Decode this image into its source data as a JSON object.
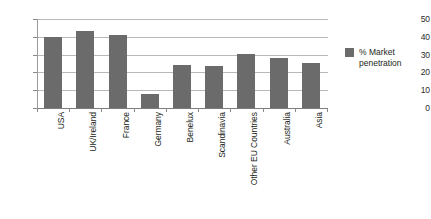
{
  "chart_data": {
    "type": "bar",
    "title": "",
    "subtitle": "",
    "xlabel": "",
    "ylabel": "",
    "ylim": [
      0,
      50
    ],
    "yticks": [
      0,
      10,
      20,
      30,
      40,
      50
    ],
    "grid": true,
    "legend_position": "right",
    "categories": [
      "USA",
      "UK/Ireland",
      "France",
      "Germany",
      "Benelux",
      "Scandinavia",
      "Other EU Countries",
      "Australia",
      "Asia"
    ],
    "series": [
      {
        "name": "% Market penetration",
        "color": "#6b6b6b",
        "values": [
          40,
          43.5,
          41,
          8,
          24,
          23.5,
          30.5,
          28,
          25.5
        ]
      }
    ]
  },
  "legend": {
    "entries": [
      {
        "label": "% Market penetration",
        "color": "#6b6b6b"
      }
    ]
  },
  "axis": {
    "y_tick_labels": [
      "50",
      "40",
      "30",
      "20",
      "10",
      "0"
    ]
  }
}
